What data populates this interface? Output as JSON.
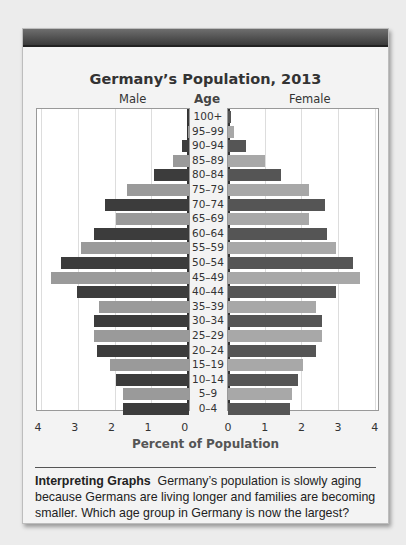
{
  "chart_data": {
    "type": "bar",
    "subtype": "population-pyramid",
    "title": "Germany’s Population, 2013",
    "xlabel": "Percent of Population",
    "ylabel": "Age",
    "left_label": "Male",
    "right_label": "Female",
    "xlim": [
      0,
      4
    ],
    "xticks": [
      0,
      1,
      2,
      3,
      4
    ],
    "grid": true,
    "categories": [
      "100+",
      "95–99",
      "90–94",
      "85–89",
      "80–84",
      "75–79",
      "70–74",
      "65–69",
      "60–64",
      "55–59",
      "50–54",
      "45–49",
      "40–44",
      "35–39",
      "30–34",
      "25–29",
      "20–24",
      "15–19",
      "10–14",
      "5–9",
      "0–4"
    ],
    "series": [
      {
        "name": "Male",
        "values": [
          0.03,
          0.03,
          0.2,
          0.45,
          0.95,
          1.7,
          2.3,
          2.0,
          2.6,
          2.95,
          3.5,
          3.75,
          3.05,
          2.45,
          2.6,
          2.6,
          2.5,
          2.15,
          2.0,
          1.8,
          1.8
        ]
      },
      {
        "name": "Female",
        "values": [
          0.08,
          0.17,
          0.5,
          1.0,
          1.45,
          2.2,
          2.65,
          2.2,
          2.7,
          2.95,
          3.4,
          3.6,
          2.95,
          2.4,
          2.55,
          2.55,
          2.4,
          2.05,
          1.9,
          1.75,
          1.7
        ]
      }
    ]
  },
  "labels": {
    "title": "Germany’s Population, 2013",
    "male": "Male",
    "age": "Age",
    "female": "Female",
    "xlabel": "Percent of Population",
    "male_ticks": [
      "4",
      "3",
      "2",
      "1",
      "0"
    ],
    "female_ticks": [
      "0",
      "1",
      "2",
      "3",
      "4"
    ]
  },
  "caption": {
    "heading": "Interpreting Graphs",
    "text": "Germany’s population is slowly aging because Germans are living longer and families are becoming smaller. Which age group in Germany is now the largest?"
  }
}
